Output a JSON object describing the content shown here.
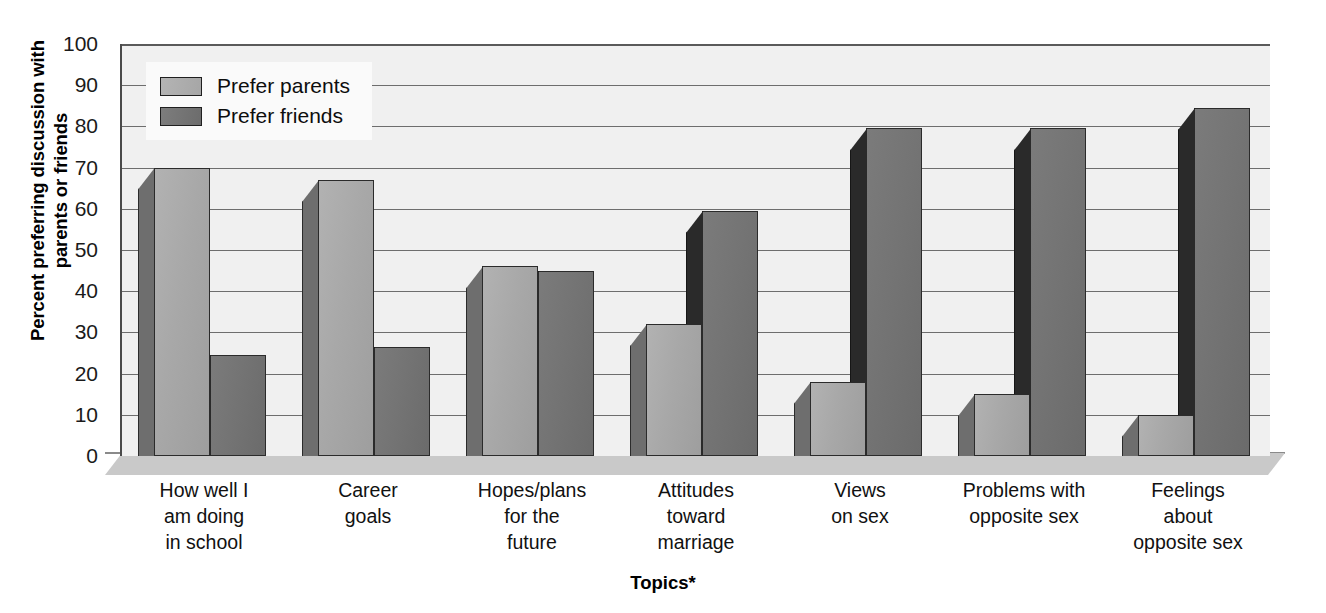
{
  "chart_data": {
    "type": "bar",
    "title": "",
    "xlabel": "Topics*",
    "ylabel": "Percent preferring discussion with parents or friends",
    "ylabel_lines": [
      "Percent preferring discussion with",
      "parents or friends"
    ],
    "ylim": [
      0,
      100
    ],
    "yticks": [
      0,
      10,
      20,
      30,
      40,
      50,
      60,
      70,
      80,
      90,
      100
    ],
    "ytick_labels": [
      "0",
      "10",
      "20",
      "30",
      "40",
      "50",
      "60",
      "70",
      "80",
      "90",
      "100"
    ],
    "grid": true,
    "legend_position": "upper-left-inside",
    "categories": [
      "How well I am doing in school",
      "Career goals",
      "Hopes/plans for the future",
      "Attitudes toward marriage",
      "Views on sex",
      "Problems with opposite sex",
      "Feelings about opposite sex"
    ],
    "category_lines": [
      [
        "How well I",
        "am doing",
        "in school"
      ],
      [
        "Career",
        "goals"
      ],
      [
        "Hopes/plans",
        "for the",
        "future"
      ],
      [
        "Attitudes",
        "toward",
        "marriage"
      ],
      [
        "Views",
        "on sex"
      ],
      [
        "Problems with",
        "opposite sex"
      ],
      [
        "Feelings",
        "about",
        "opposite sex"
      ]
    ],
    "series": [
      {
        "name": "Prefer parents",
        "color": "#a8a8a8",
        "values": [
          70,
          67,
          46,
          32,
          18,
          15,
          10
        ]
      },
      {
        "name": "Prefer friends",
        "color": "#707070",
        "values": [
          24.5,
          26.5,
          45,
          59.5,
          79.5,
          79.5,
          84.5
        ]
      }
    ]
  },
  "legend": {
    "items": [
      {
        "label": "Prefer parents",
        "swatch": "legend-swatch-parents"
      },
      {
        "label": "Prefer friends",
        "swatch": "legend-swatch-friends"
      }
    ]
  },
  "axes": {
    "y_title_line1": "Percent preferring discussion with",
    "y_title_line2": "parents or friends",
    "x_title": "Topics*"
  },
  "colors": {
    "series_parents": "#a8a8a8",
    "series_friends": "#707070",
    "plot_background": "#f0f0f0",
    "gridline": "#6d6d6d",
    "floor": "#c9c9c9",
    "text": "#111111"
  }
}
